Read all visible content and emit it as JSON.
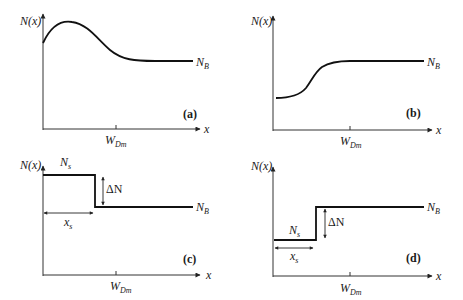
{
  "figure": {
    "panels": [
      {
        "id": "a",
        "label": "(a)",
        "y_axis_label": "N(x)",
        "x_axis_label": "x",
        "tick_label_main": "W",
        "tick_label_sub": "Dm",
        "level_label_main": "N",
        "level_label_sub": "B",
        "description": "Profile rises from surface to a peak near the surface, then decays to constant background N_B"
      },
      {
        "id": "b",
        "label": "(b)",
        "y_axis_label": "N(x)",
        "x_axis_label": "x",
        "tick_label_main": "W",
        "tick_label_sub": "Dm",
        "level_label_main": "N",
        "level_label_sub": "B",
        "description": "Profile starts low at surface and rises smoothly (S-shape) to constant background N_B"
      },
      {
        "id": "c",
        "label": "(c)",
        "y_axis_label": "N(x)",
        "x_axis_label": "x",
        "tick_label_main": "W",
        "tick_label_sub": "Dm",
        "level_label_main": "N",
        "level_label_sub": "B",
        "surface_label_main": "N",
        "surface_label_sub": "s",
        "step_label": "ΔN",
        "width_label_main": "x",
        "width_label_sub": "s",
        "description": "Step profile: high N_s for 0<x<x_s, then drops by ΔN to N_B"
      },
      {
        "id": "d",
        "label": "(d)",
        "y_axis_label": "N(x)",
        "x_axis_label": "x",
        "tick_label_main": "W",
        "tick_label_sub": "Dm",
        "level_label_main": "N",
        "level_label_sub": "B",
        "surface_label_main": "N",
        "surface_label_sub": "s",
        "step_label": "ΔN",
        "width_label_main": "x",
        "width_label_sub": "s",
        "description": "Step profile: low N_s for 0<x<x_s, then rises by ΔN to N_B"
      }
    ]
  },
  "colors": {
    "line": "#111111",
    "axis": "#333333",
    "background": "#ffffff"
  }
}
